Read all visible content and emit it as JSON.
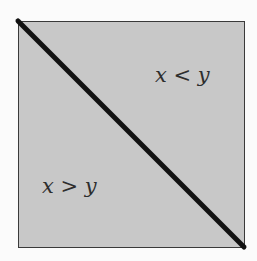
{
  "diagram": {
    "region_upper": {
      "label": "x < y"
    },
    "region_lower": {
      "label": "x > y"
    },
    "colors": {
      "fill": "#c8c8c8",
      "line": "#111111",
      "border": "#3a3a3a"
    }
  }
}
